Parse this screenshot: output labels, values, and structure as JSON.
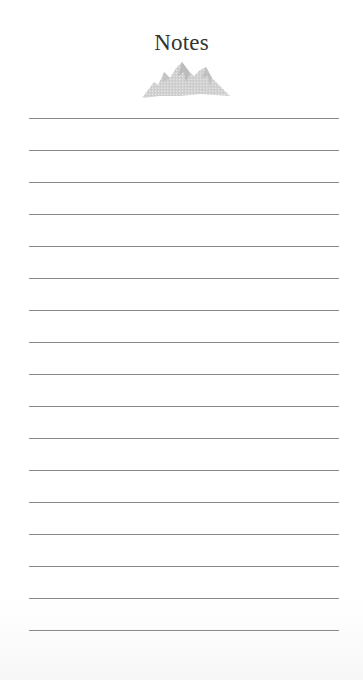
{
  "header": {
    "title": "Notes",
    "icon": "mountain-icon"
  },
  "notes": {
    "line_count": 17,
    "first_line_y": 118,
    "line_spacing": 32,
    "line_color": "#8a8a8a",
    "lines": [
      "",
      "",
      "",
      "",
      "",
      "",
      "",
      "",
      "",
      "",
      "",
      "",
      "",
      "",
      "",
      "",
      ""
    ]
  }
}
